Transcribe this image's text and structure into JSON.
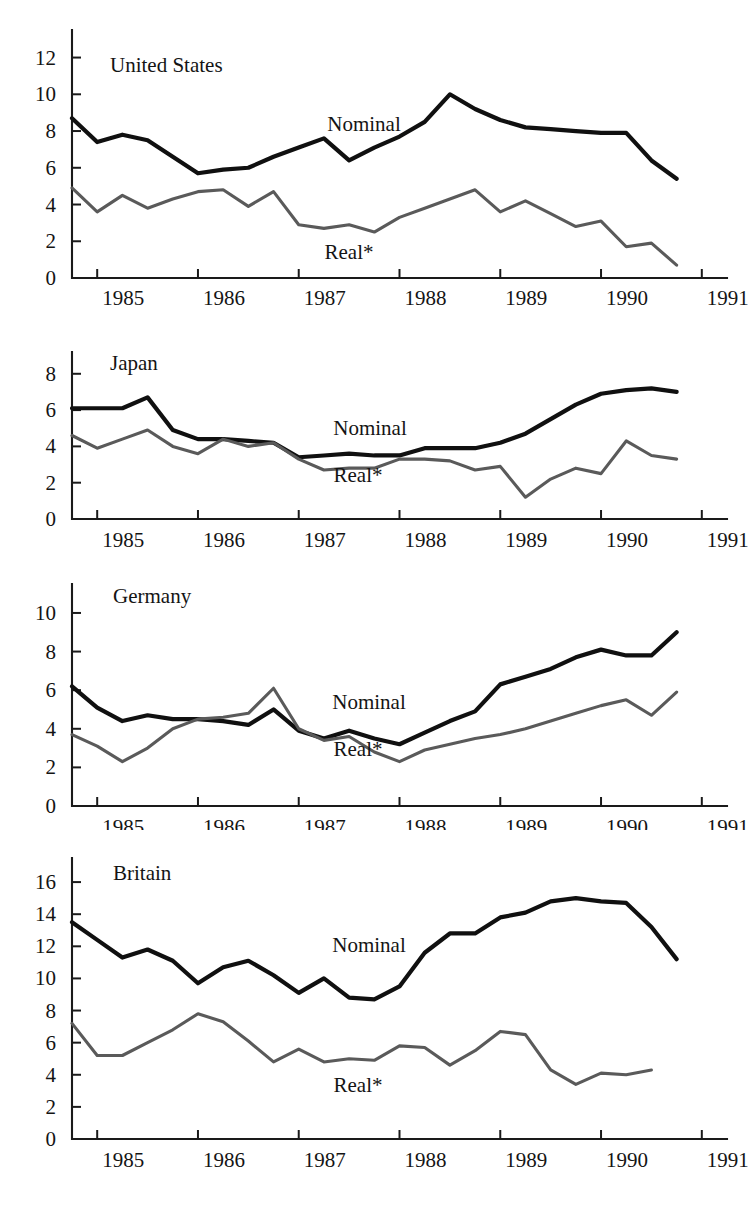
{
  "figure": {
    "background": "#ffffff",
    "nominal_color": "#101010",
    "real_color": "#5a5a5a",
    "axis_color": "#1a1a1a"
  },
  "labels": {
    "nominal": "Nominal",
    "real": "Real*"
  },
  "chart_data": [
    {
      "type": "line",
      "title": "United States",
      "xlabel": "",
      "ylabel": "",
      "ylim": [
        0,
        13.5
      ],
      "yticks": [
        0,
        2,
        4,
        6,
        8,
        10,
        12
      ],
      "xlim": [
        1984.75,
        1991.25
      ],
      "xticks": [
        1985,
        1986,
        1987,
        1988,
        1989,
        1990,
        1991
      ],
      "xticklabels": [
        "1985",
        "1986",
        "1987",
        "1988",
        "1989",
        "1990",
        "1991"
      ],
      "grid": false,
      "legend": "inline-annotations",
      "x": [
        1984.75,
        1985.0,
        1985.25,
        1985.5,
        1985.75,
        1986.0,
        1986.25,
        1986.5,
        1986.75,
        1987.0,
        1987.25,
        1987.5,
        1987.75,
        1988.0,
        1988.25,
        1988.5,
        1988.75,
        1989.0,
        1989.25,
        1989.5,
        1989.75,
        1990.0,
        1990.25,
        1990.5,
        1990.75
      ],
      "series": [
        {
          "name": "Nominal",
          "values": [
            8.7,
            7.4,
            7.8,
            7.5,
            6.6,
            5.7,
            5.9,
            6.0,
            6.6,
            7.1,
            7.6,
            6.4,
            7.1,
            7.7,
            8.5,
            10.0,
            9.2,
            8.6,
            8.2,
            8.1,
            8.0,
            7.9,
            7.9,
            6.4,
            5.4
          ]
        },
        {
          "name": "Real*",
          "values": [
            4.9,
            3.6,
            4.5,
            3.8,
            4.3,
            4.7,
            4.8,
            3.9,
            4.7,
            2.9,
            2.7,
            2.9,
            2.5,
            3.3,
            3.8,
            4.3,
            4.8,
            3.6,
            4.2,
            3.5,
            2.8,
            3.1,
            1.7,
            1.9,
            0.7
          ]
        }
      ]
    },
    {
      "type": "line",
      "title": "Japan",
      "xlabel": "",
      "ylabel": "",
      "ylim": [
        0,
        9.2
      ],
      "yticks": [
        0,
        2,
        4,
        6,
        8
      ],
      "xlim": [
        1984.75,
        1991.25
      ],
      "xticks": [
        1985,
        1986,
        1987,
        1988,
        1989,
        1990,
        1991
      ],
      "xticklabels": [
        "1985",
        "1986",
        "1987",
        "1988",
        "1989",
        "1990",
        "1991"
      ],
      "grid": false,
      "legend": "inline-annotations",
      "x": [
        1984.75,
        1985.0,
        1985.25,
        1985.5,
        1985.75,
        1986.0,
        1986.25,
        1986.5,
        1986.75,
        1987.0,
        1987.25,
        1987.5,
        1987.75,
        1988.0,
        1988.25,
        1988.5,
        1988.75,
        1989.0,
        1989.25,
        1989.5,
        1989.75,
        1990.0,
        1990.25,
        1990.5,
        1990.75
      ],
      "series": [
        {
          "name": "Nominal",
          "values": [
            6.1,
            6.1,
            6.1,
            6.7,
            4.9,
            4.4,
            4.4,
            4.3,
            4.2,
            3.4,
            3.5,
            3.6,
            3.5,
            3.5,
            3.9,
            3.9,
            3.9,
            4.2,
            4.7,
            5.5,
            6.3,
            6.9,
            7.1,
            7.2,
            7.0
          ]
        },
        {
          "name": "Real*",
          "values": [
            4.6,
            3.9,
            4.4,
            4.9,
            4.0,
            3.6,
            4.4,
            4.0,
            4.2,
            3.3,
            2.7,
            2.8,
            2.8,
            3.3,
            3.3,
            3.2,
            2.7,
            2.9,
            1.2,
            2.2,
            2.8,
            2.5,
            4.3,
            3.5,
            3.3,
            3.0
          ]
        }
      ]
    },
    {
      "type": "line",
      "title": "Germany",
      "xlabel": "",
      "ylabel": "",
      "ylim": [
        0,
        11.5
      ],
      "yticks": [
        0,
        2,
        4,
        6,
        8,
        10
      ],
      "xlim": [
        1984.75,
        1991.25
      ],
      "xticks": [
        1985,
        1986,
        1987,
        1988,
        1989,
        1990,
        1991
      ],
      "xticklabels": [
        "1985",
        "1986",
        "1987",
        "1988",
        "1989",
        "1990",
        "1991"
      ],
      "grid": false,
      "legend": "inline-annotations",
      "x": [
        1984.75,
        1985.0,
        1985.25,
        1985.5,
        1985.75,
        1986.0,
        1986.25,
        1986.5,
        1986.75,
        1987.0,
        1987.25,
        1987.5,
        1987.75,
        1988.0,
        1988.25,
        1988.5,
        1988.75,
        1989.0,
        1989.25,
        1989.5,
        1989.75,
        1990.0,
        1990.25,
        1990.5,
        1990.75
      ],
      "series": [
        {
          "name": "Nominal",
          "values": [
            6.2,
            5.1,
            4.4,
            4.7,
            4.5,
            4.5,
            4.4,
            4.2,
            5.0,
            3.9,
            3.5,
            3.9,
            3.5,
            3.2,
            3.8,
            4.4,
            4.9,
            6.3,
            6.7,
            7.1,
            7.7,
            8.1,
            7.8,
            7.8,
            9.0,
            8.7,
            8.5
          ]
        },
        {
          "name": "Real*",
          "values": [
            3.7,
            3.1,
            2.3,
            3.0,
            4.0,
            4.5,
            4.6,
            4.8,
            6.1,
            4.0,
            3.4,
            3.6,
            2.8,
            2.3,
            2.9,
            3.2,
            3.5,
            3.7,
            4.0,
            4.4,
            4.8,
            5.2,
            5.5,
            4.7,
            5.9,
            6.1,
            5.6
          ]
        }
      ]
    },
    {
      "type": "line",
      "title": "Britain",
      "xlabel": "",
      "ylabel": "",
      "ylim": [
        0,
        17.5
      ],
      "yticks": [
        0,
        2,
        4,
        6,
        8,
        10,
        12,
        14,
        16
      ],
      "xlim": [
        1984.75,
        1991.25
      ],
      "xticks": [
        1985,
        1986,
        1987,
        1988,
        1989,
        1990,
        1991
      ],
      "xticklabels": [
        "1985",
        "1986",
        "1987",
        "1988",
        "1989",
        "1990",
        "1991"
      ],
      "grid": false,
      "legend": "inline-annotations",
      "x": [
        1984.75,
        1985.0,
        1985.25,
        1985.5,
        1985.75,
        1986.0,
        1986.25,
        1986.5,
        1986.75,
        1987.0,
        1987.25,
        1987.5,
        1987.75,
        1988.0,
        1988.25,
        1988.5,
        1988.75,
        1989.0,
        1989.25,
        1989.5,
        1989.75,
        1990.0,
        1990.25,
        1990.5,
        1990.75
      ],
      "series": [
        {
          "name": "Nominal",
          "values": [
            13.5,
            12.4,
            11.3,
            11.8,
            11.1,
            9.7,
            10.7,
            11.1,
            10.2,
            9.1,
            10.0,
            8.8,
            8.7,
            9.5,
            11.6,
            12.8,
            12.8,
            13.8,
            14.1,
            14.8,
            15.0,
            14.8,
            14.7,
            13.2,
            11.2
          ]
        },
        {
          "name": "Real*",
          "values": [
            7.2,
            5.2,
            5.2,
            6.0,
            6.8,
            7.8,
            7.3,
            6.1,
            4.8,
            5.6,
            4.8,
            5.0,
            4.9,
            5.8,
            5.7,
            4.6,
            5.5,
            6.7,
            6.5,
            4.3,
            3.4,
            4.1,
            4.0,
            4.3
          ]
        }
      ]
    }
  ]
}
